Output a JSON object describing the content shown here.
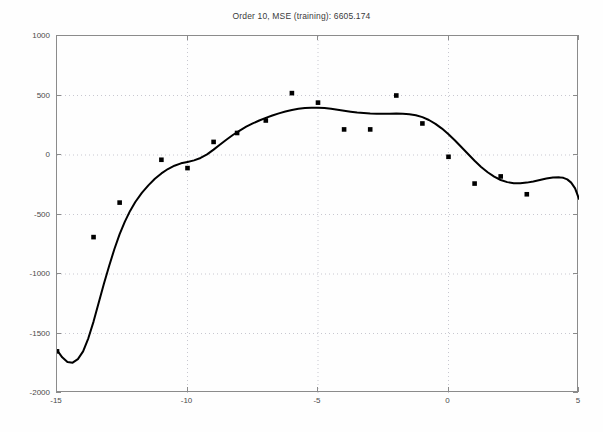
{
  "chart_data": {
    "type": "scatter",
    "title": "Order 10, MSE (training): 6605.174",
    "xlabel": "",
    "ylabel": "",
    "xlim": [
      -15,
      5
    ],
    "ylim": [
      -2000,
      1000
    ],
    "xticks": [
      -15,
      -10,
      -5,
      0,
      5
    ],
    "yticks": [
      1000,
      500,
      0,
      -500,
      -1000,
      -1500,
      -2000
    ],
    "xtick_labels": [
      "-15",
      "-10",
      "-5",
      "0",
      "5"
    ],
    "ytick_labels": [
      "1000",
      "500",
      "0",
      "-500",
      "-1000",
      "-1500",
      "-2000"
    ],
    "grid": true,
    "grid_style": "dotted",
    "legend": null,
    "series": [
      {
        "name": "training data",
        "type": "scatter",
        "marker": "square",
        "color": "#000000",
        "points": [
          {
            "x": -15.0,
            "y": -1650
          },
          {
            "x": -13.6,
            "y": -690
          },
          {
            "x": -12.6,
            "y": -400
          },
          {
            "x": -11.0,
            "y": -40
          },
          {
            "x": -10.0,
            "y": -110
          },
          {
            "x": -9.0,
            "y": 110
          },
          {
            "x": -8.1,
            "y": 185
          },
          {
            "x": -7.0,
            "y": 290
          },
          {
            "x": -6.0,
            "y": 520
          },
          {
            "x": -5.0,
            "y": 440
          },
          {
            "x": -4.0,
            "y": 215
          },
          {
            "x": -3.0,
            "y": 215
          },
          {
            "x": -2.0,
            "y": 500
          },
          {
            "x": -1.0,
            "y": 265
          },
          {
            "x": 0.0,
            "y": -15
          },
          {
            "x": 1.0,
            "y": -240
          },
          {
            "x": 2.0,
            "y": -180
          },
          {
            "x": 3.0,
            "y": -330
          }
        ]
      },
      {
        "name": "order-10 polynomial fit",
        "type": "line",
        "color": "#000000",
        "linewidth": 2,
        "points": [
          {
            "x": -15.0,
            "y": -1640
          },
          {
            "x": -14.8,
            "y": -1700
          },
          {
            "x": -14.6,
            "y": -1740
          },
          {
            "x": -14.4,
            "y": -1745
          },
          {
            "x": -14.2,
            "y": -1715
          },
          {
            "x": -14.0,
            "y": -1650
          },
          {
            "x": -13.8,
            "y": -1540
          },
          {
            "x": -13.6,
            "y": -1400
          },
          {
            "x": -13.4,
            "y": -1240
          },
          {
            "x": -13.2,
            "y": -1080
          },
          {
            "x": -13.0,
            "y": -930
          },
          {
            "x": -12.8,
            "y": -790
          },
          {
            "x": -12.6,
            "y": -665
          },
          {
            "x": -12.4,
            "y": -560
          },
          {
            "x": -12.2,
            "y": -470
          },
          {
            "x": -12.0,
            "y": -395
          },
          {
            "x": -11.75,
            "y": -318
          },
          {
            "x": -11.5,
            "y": -255
          },
          {
            "x": -11.25,
            "y": -200
          },
          {
            "x": -11.0,
            "y": -155
          },
          {
            "x": -10.75,
            "y": -118
          },
          {
            "x": -10.5,
            "y": -90
          },
          {
            "x": -10.25,
            "y": -70
          },
          {
            "x": -10.0,
            "y": -58
          },
          {
            "x": -9.75,
            "y": -45
          },
          {
            "x": -9.5,
            "y": -25
          },
          {
            "x": -9.25,
            "y": 5
          },
          {
            "x": -9.0,
            "y": 45
          },
          {
            "x": -8.75,
            "y": 88
          },
          {
            "x": -8.5,
            "y": 130
          },
          {
            "x": -8.25,
            "y": 170
          },
          {
            "x": -8.0,
            "y": 205
          },
          {
            "x": -7.75,
            "y": 238
          },
          {
            "x": -7.5,
            "y": 265
          },
          {
            "x": -7.25,
            "y": 290
          },
          {
            "x": -7.0,
            "y": 312
          },
          {
            "x": -6.75,
            "y": 332
          },
          {
            "x": -6.5,
            "y": 350
          },
          {
            "x": -6.25,
            "y": 365
          },
          {
            "x": -6.0,
            "y": 378
          },
          {
            "x": -5.75,
            "y": 388
          },
          {
            "x": -5.5,
            "y": 395
          },
          {
            "x": -5.25,
            "y": 398
          },
          {
            "x": -5.0,
            "y": 398
          },
          {
            "x": -4.75,
            "y": 394
          },
          {
            "x": -4.5,
            "y": 388
          },
          {
            "x": -4.25,
            "y": 380
          },
          {
            "x": -4.0,
            "y": 372
          },
          {
            "x": -3.75,
            "y": 364
          },
          {
            "x": -3.5,
            "y": 357
          },
          {
            "x": -3.25,
            "y": 352
          },
          {
            "x": -3.0,
            "y": 348
          },
          {
            "x": -2.75,
            "y": 346
          },
          {
            "x": -2.5,
            "y": 346
          },
          {
            "x": -2.25,
            "y": 347
          },
          {
            "x": -2.0,
            "y": 348
          },
          {
            "x": -1.75,
            "y": 347
          },
          {
            "x": -1.5,
            "y": 343
          },
          {
            "x": -1.25,
            "y": 334
          },
          {
            "x": -1.0,
            "y": 318
          },
          {
            "x": -0.75,
            "y": 294
          },
          {
            "x": -0.5,
            "y": 262
          },
          {
            "x": -0.25,
            "y": 222
          },
          {
            "x": 0.0,
            "y": 175
          },
          {
            "x": 0.25,
            "y": 122
          },
          {
            "x": 0.5,
            "y": 65
          },
          {
            "x": 0.75,
            "y": 8
          },
          {
            "x": 1.0,
            "y": -48
          },
          {
            "x": 1.25,
            "y": -100
          },
          {
            "x": 1.5,
            "y": -145
          },
          {
            "x": 1.75,
            "y": -182
          },
          {
            "x": 2.0,
            "y": -210
          },
          {
            "x": 2.25,
            "y": -228
          },
          {
            "x": 2.5,
            "y": -237
          },
          {
            "x": 2.75,
            "y": -238
          },
          {
            "x": 3.0,
            "y": -232
          },
          {
            "x": 3.25,
            "y": -222
          },
          {
            "x": 3.5,
            "y": -210
          },
          {
            "x": 3.75,
            "y": -198
          },
          {
            "x": 4.0,
            "y": -190
          },
          {
            "x": 4.25,
            "y": -188
          },
          {
            "x": 4.4,
            "y": -192
          },
          {
            "x": 4.55,
            "y": -205
          },
          {
            "x": 4.7,
            "y": -232
          },
          {
            "x": 4.85,
            "y": -280
          },
          {
            "x": 5.0,
            "y": -370
          }
        ]
      }
    ]
  },
  "colors": {
    "axis": "#8b8b8b",
    "grid": "#c8c8d0",
    "data": "#000000",
    "text": "#4a4a4a",
    "background": "#fefefe"
  }
}
